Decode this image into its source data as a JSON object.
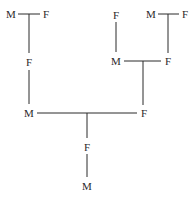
{
  "diagram": {
    "type": "pedigree",
    "line_color": "#2a2a2a",
    "nodes": [
      {
        "id": "g1_m",
        "label": "M",
        "x": 11,
        "y": 14
      },
      {
        "id": "g1_f",
        "label": "F",
        "x": 46,
        "y": 14
      },
      {
        "id": "p1_f",
        "label": "F",
        "x": 29,
        "y": 62
      },
      {
        "id": "g2_f",
        "label": "F",
        "x": 116,
        "y": 15
      },
      {
        "id": "g3_m",
        "label": "M",
        "x": 151,
        "y": 14
      },
      {
        "id": "g3_f",
        "label": "F",
        "x": 185,
        "y": 14
      },
      {
        "id": "p2_m",
        "label": "M",
        "x": 116,
        "y": 61
      },
      {
        "id": "p2_f",
        "label": "F",
        "x": 168,
        "y": 61
      },
      {
        "id": "c1_m",
        "label": "M",
        "x": 29,
        "y": 113
      },
      {
        "id": "c1_f",
        "label": "F",
        "x": 144,
        "y": 113
      },
      {
        "id": "d_f",
        "label": "F",
        "x": 87,
        "y": 147
      },
      {
        "id": "d_m",
        "label": "M",
        "x": 87,
        "y": 186
      }
    ]
  }
}
